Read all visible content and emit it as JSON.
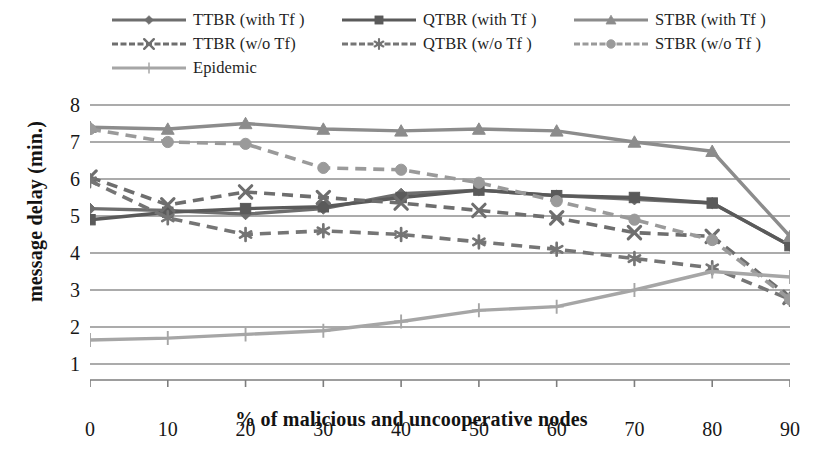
{
  "chart_data": {
    "type": "line",
    "title": "",
    "xlabel": "% of malicious and uncooperative nodes",
    "ylabel": "message delay (min.)",
    "x": [
      0,
      10,
      20,
      30,
      40,
      50,
      60,
      70,
      80,
      90
    ],
    "xlim": [
      0,
      90
    ],
    "ylim": [
      1,
      8
    ],
    "xticks": [
      "0",
      "10",
      "20",
      "30",
      "40",
      "50",
      "60",
      "70",
      "80",
      "90"
    ],
    "yticks": [
      "1",
      "2",
      "3",
      "4",
      "5",
      "6",
      "7",
      "8"
    ],
    "grid": "horizontal",
    "legend_position": "top",
    "series": [
      {
        "name": "TTBR (with Tf )",
        "key": "ttbr-with-tf",
        "marker": "diamond",
        "dash": "solid",
        "color": "#6e6e6e",
        "values": [
          5.2,
          5.15,
          5.05,
          5.2,
          5.6,
          5.7,
          5.55,
          5.45,
          5.35,
          4.2
        ]
      },
      {
        "name": "QTBR (with Tf )",
        "key": "qtbr-with-tf",
        "marker": "square",
        "dash": "solid",
        "color": "#5a5a5a",
        "values": [
          4.9,
          5.1,
          5.2,
          5.25,
          5.5,
          5.7,
          5.55,
          5.5,
          5.35,
          4.2
        ]
      },
      {
        "name": "STBR (with Tf )",
        "key": "stbr-with-tf",
        "marker": "triangle",
        "dash": "solid",
        "color": "#8c8c8c",
        "values": [
          7.4,
          7.35,
          7.5,
          7.35,
          7.3,
          7.35,
          7.3,
          7.0,
          6.75,
          4.45
        ]
      },
      {
        "name": "TTBR (w/o Tf)",
        "key": "ttbr-wo-tf",
        "marker": "x",
        "dash": "dashed",
        "color": "#6e6e6e",
        "values": [
          6.05,
          5.3,
          5.65,
          5.5,
          5.35,
          5.15,
          4.95,
          4.55,
          4.45,
          2.8
        ]
      },
      {
        "name": "QTBR (w/o Tf )",
        "key": "qtbr-wo-tf",
        "marker": "asterisk",
        "dash": "dashed",
        "color": "#757575",
        "values": [
          5.95,
          4.95,
          4.5,
          4.6,
          4.5,
          4.3,
          4.1,
          3.85,
          3.6,
          2.75
        ]
      },
      {
        "name": "STBR (w/o Tf )",
        "key": "stbr-wo-tf",
        "marker": "circle",
        "dash": "dashed",
        "color": "#9a9a9a",
        "values": [
          7.35,
          7.0,
          6.95,
          6.3,
          6.25,
          5.9,
          5.4,
          4.9,
          4.35,
          2.75
        ]
      },
      {
        "name": "Epidemic",
        "key": "epidemic",
        "marker": "plus",
        "dash": "solid",
        "color": "#a6a6a6",
        "values": [
          1.65,
          1.7,
          1.8,
          1.9,
          2.15,
          2.45,
          2.55,
          3.0,
          3.5,
          3.35
        ]
      }
    ]
  },
  "legend": {
    "rows": [
      [
        {
          "label": "TTBR (with Tf )",
          "series": 0
        },
        {
          "label": "QTBR (with Tf )",
          "series": 1
        },
        {
          "label": "STBR (with Tf )",
          "series": 2
        }
      ],
      [
        {
          "label": "TTBR (w/o Tf)",
          "series": 3
        },
        {
          "label": "QTBR (w/o Tf )",
          "series": 4
        },
        {
          "label": "STBR (w/o Tf )",
          "series": 5
        }
      ],
      [
        {
          "label": "Epidemic",
          "series": 6
        }
      ]
    ]
  },
  "axes": {
    "y_title": "message delay (min.)",
    "x_title": "% of malicious and uncooperative nodes"
  },
  "colors": {
    "background": "#ffffff",
    "gridline": "#8f8f8f",
    "axis": "#7d7d7d",
    "text": "#1c1c1c"
  }
}
